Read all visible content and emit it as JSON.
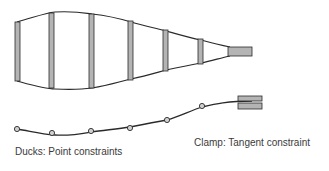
{
  "labels": {
    "ducks": "Ducks: Point constraints",
    "clamp": "Clamp: Tangent constraint"
  },
  "colors": {
    "stroke": "#2a2a2a",
    "bar_fill": "#b4b4b4",
    "text": "#3a3a3a"
  },
  "spline_shape": {
    "ribs": [
      {
        "x": 15,
        "top": 22,
        "bottom": 81
      },
      {
        "x": 49,
        "top": 13,
        "bottom": 88
      },
      {
        "x": 89,
        "top": 14,
        "bottom": 88
      },
      {
        "x": 128,
        "top": 21,
        "bottom": 80
      },
      {
        "x": 163,
        "top": 30,
        "bottom": 71
      },
      {
        "x": 198,
        "top": 39,
        "bottom": 64
      }
    ],
    "end_block": {
      "x": 228,
      "y": 47,
      "w": 24,
      "h": 9
    }
  },
  "constrained_curve": {
    "ducks": [
      {
        "x": 17,
        "y": 129
      },
      {
        "x": 52,
        "y": 133
      },
      {
        "x": 91,
        "y": 132
      },
      {
        "x": 130,
        "y": 128
      },
      {
        "x": 167,
        "y": 120
      },
      {
        "x": 202,
        "y": 107
      }
    ],
    "clamp": {
      "x": 238,
      "y": 96,
      "w": 24,
      "h": 13
    }
  }
}
